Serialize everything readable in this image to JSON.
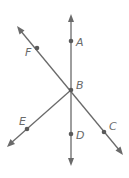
{
  "diagram": {
    "type": "geometry-lines-and-rays",
    "colors": {
      "line": "#6a6a6a",
      "point": "#5a5a5a",
      "label": "#6a6a6a"
    },
    "points": [
      {
        "name": "A",
        "x": 71,
        "y": 41,
        "label_x": 76,
        "label_y": 46
      },
      {
        "name": "B",
        "x": 71,
        "y": 90,
        "label_x": 76,
        "label_y": 89
      },
      {
        "name": "C",
        "x": 104,
        "y": 132,
        "label_x": 109,
        "label_y": 130
      },
      {
        "name": "D",
        "x": 71,
        "y": 134,
        "label_x": 76,
        "label_y": 139
      },
      {
        "name": "E",
        "x": 27,
        "y": 129,
        "label_x": 19,
        "label_y": 125
      },
      {
        "name": "F",
        "x": 37,
        "y": 48,
        "label_x": 25,
        "label_y": 56
      }
    ],
    "lines": [
      {
        "name": "line-AD",
        "through": [
          "A",
          "B",
          "D"
        ],
        "from": [
          71,
          16
        ],
        "to": [
          71,
          164
        ],
        "arrows": "both"
      },
      {
        "name": "line-FC",
        "through": [
          "F",
          "B",
          "C"
        ],
        "from": [
          18,
          27
        ],
        "to": [
          122,
          154
        ],
        "arrows": "both"
      }
    ],
    "rays": [
      {
        "name": "ray-BE",
        "from": "B",
        "through": "E",
        "end": [
          8,
          146
        ],
        "arrows": "end"
      }
    ]
  }
}
